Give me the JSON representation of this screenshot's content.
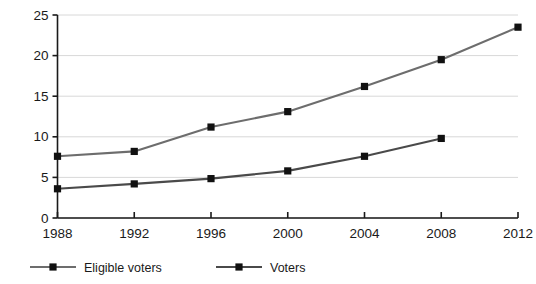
{
  "chart_data": {
    "type": "line",
    "title": "",
    "subtitle": "",
    "xlabel": "",
    "ylabel": "",
    "x": [
      1988,
      1992,
      1996,
      2000,
      2004,
      2008,
      2012
    ],
    "categories": [
      "1988",
      "1992",
      "1996",
      "2000",
      "2004",
      "2008",
      "2012"
    ],
    "xlim": [
      1988,
      2012
    ],
    "ylim": [
      0,
      25
    ],
    "xticks": [
      "1988",
      "1992",
      "1996",
      "2000",
      "2004",
      "2008",
      "2012"
    ],
    "yticks": [
      "0",
      "5",
      "10",
      "15",
      "20",
      "25"
    ],
    "ytick_values": [
      0,
      5,
      10,
      15,
      20,
      25
    ],
    "grid": "horizontal",
    "legend_position": "bottom-left",
    "series": [
      {
        "name": "Eligible voters",
        "color": "#6d6d6d",
        "marker": "square",
        "marker_color": "#111111",
        "x": [
          1988,
          1992,
          1996,
          2000,
          2004,
          2008,
          2012
        ],
        "values": [
          7.6,
          8.2,
          11.2,
          13.1,
          16.2,
          19.5,
          23.5
        ]
      },
      {
        "name": "Voters",
        "color": "#4a4a4a",
        "marker": "square",
        "marker_color": "#111111",
        "x": [
          1988,
          1992,
          1996,
          2000,
          2004,
          2008
        ],
        "values": [
          3.6,
          4.2,
          4.85,
          5.8,
          7.6,
          9.8
        ]
      }
    ]
  },
  "legend": {
    "items": [
      {
        "label": "Eligible voters"
      },
      {
        "label": "Voters"
      }
    ]
  },
  "colors": {
    "gridline": "#d8d8d8",
    "axis": "#1a1a1a",
    "background": "#ffffff",
    "series_eligible": "#6d6d6d",
    "series_voters": "#4a4a4a",
    "marker": "#111111"
  }
}
